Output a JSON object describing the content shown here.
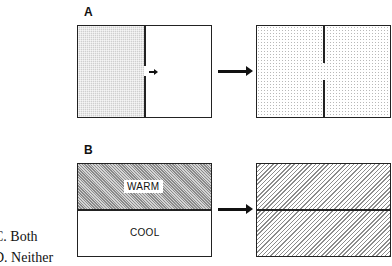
{
  "panels": {
    "a": {
      "label": "A",
      "before": {
        "left_fill": "dense grid shading",
        "right_fill": "white",
        "small_arrow_direction": "right"
      },
      "after": {
        "fill": "light dotted",
        "partial_divider": true
      }
    },
    "b": {
      "label": "B",
      "before": {
        "top_label": "WARM",
        "bottom_label": "COOL",
        "top_fill": "dense hatch",
        "bottom_fill": "white"
      },
      "after": {
        "fill": "diagonal hatch",
        "divider": true
      }
    }
  },
  "answer_choices": [
    {
      "text": "C.  Both"
    },
    {
      "text": "D.  Neither"
    }
  ],
  "colors": {
    "line": "#222222",
    "background": "#ffffff"
  }
}
